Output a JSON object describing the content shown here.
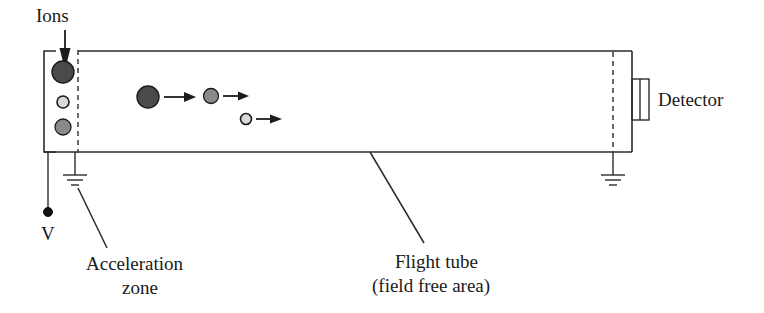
{
  "figure": {
    "type": "schematic-diagram",
    "labels": {
      "ions": "Ions",
      "voltage": "V",
      "acceleration_zone_line1": "Acceleration",
      "acceleration_zone_line2": "zone",
      "flight_tube_line1": "Flight tube",
      "flight_tube_line2": "(field free area)",
      "detector": "Detector"
    },
    "colors": {
      "line": "#2b2b2b",
      "text": "#1a1a1a",
      "ion_dark": "#4a4a4a",
      "ion_mid": "#8a8a8a",
      "ion_light": "#d8d8d8",
      "background": "#ffffff"
    },
    "source_ions": [
      {
        "name": "large-ion",
        "shade": "dark",
        "r": 11
      },
      {
        "name": "small-ion",
        "shade": "light",
        "r": 6
      },
      {
        "name": "medium-ion",
        "shade": "mid",
        "r": 8
      }
    ],
    "flying_ions": [
      {
        "name": "large-flying-ion",
        "shade": "dark",
        "r": 11
      },
      {
        "name": "medium-flying-ion",
        "shade": "mid",
        "r": 7.5
      },
      {
        "name": "small-flying-ion",
        "shade": "light",
        "r": 5.5
      }
    ],
    "ground_symbols": 2,
    "detector_elements": 2
  }
}
